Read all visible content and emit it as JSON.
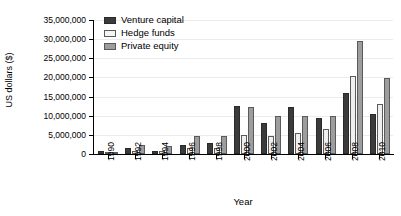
{
  "chart_data": {
    "type": "bar",
    "title": "",
    "xlabel": "Year",
    "ylabel": "US dollars ($)",
    "categories": [
      "1990",
      "1992",
      "1994",
      "1996",
      "1998",
      "2000",
      "2002",
      "2004",
      "2006",
      "2008",
      "2010"
    ],
    "series": [
      {
        "name": "Venture capital",
        "color": "#3b3b3b",
        "values": [
          900000,
          1600000,
          900000,
          2400000,
          2900000,
          12600000,
          8000000,
          12300000,
          9500000,
          16000000,
          10500000
        ]
      },
      {
        "name": "Hedge funds",
        "color": "#efefef",
        "values": [
          500000,
          700000,
          700000,
          1700000,
          1500000,
          5000000,
          4700000,
          5500000,
          6500000,
          20500000,
          13000000
        ]
      },
      {
        "name": "Private equity",
        "color": "#9d9d9d",
        "values": [
          400000,
          2400000,
          2000000,
          4700000,
          4800000,
          12400000,
          9800000,
          10000000,
          9800000,
          29500000,
          19800000
        ]
      }
    ],
    "ylim": [
      0,
      35000000
    ],
    "yticks": [
      0,
      5000000,
      10000000,
      15000000,
      20000000,
      25000000,
      30000000,
      35000000
    ],
    "ytick_labels": [
      "0",
      "5,000,000",
      "10,000,000",
      "15,000,000",
      "20,000,000",
      "25,000,000",
      "30,000,000",
      "35,000,000"
    ],
    "grid": true,
    "legend_position": "top-left"
  },
  "legend": {
    "items": [
      {
        "label": "Venture capital"
      },
      {
        "label": "Hedge funds"
      },
      {
        "label": "Private equity"
      }
    ]
  },
  "axes": {
    "x_title": "Year",
    "y_title": "US dollars ($)"
  }
}
